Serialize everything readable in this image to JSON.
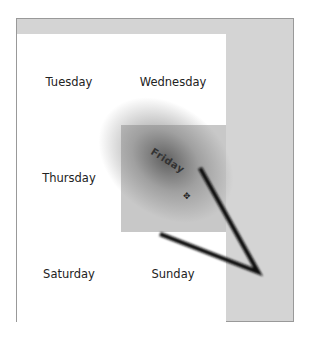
{
  "calendar": {
    "days": {
      "tuesday": "Tuesday",
      "wednesday": "Wednesday",
      "thursday": "Thursday",
      "friday": "Friday",
      "saturday": "Saturday",
      "sunday": "Sunday"
    }
  },
  "drag": {
    "item_label": "Friday",
    "cursor_icon": "move-cursor-icon"
  },
  "colors": {
    "frame_bg": "#d4d4d4",
    "grid_bg": "#ffffff",
    "tile_bg": "#c8c8c8",
    "arrow": "#111111"
  }
}
